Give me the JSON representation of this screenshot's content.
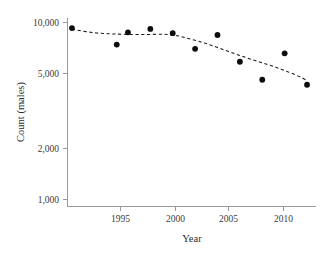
{
  "chart_data": {
    "type": "scatter",
    "title": "",
    "subtitle": "",
    "xlabel": "Year",
    "ylabel": "Count (males)",
    "yscale": "log",
    "xscale": "linear",
    "grid": false,
    "legend": null,
    "xlim": [
      1990.6,
      2012.8
    ],
    "ylim": [
      1000,
      11000
    ],
    "xticks": [
      1995,
      2000,
      2005,
      2010
    ],
    "xtick_labels": [
      "1995",
      "2000",
      "2005",
      "2010"
    ],
    "yticks": [
      1000,
      2000,
      5000,
      10000
    ],
    "ytick_labels": [
      "1,000",
      "2,000",
      "5,000",
      "10,000"
    ],
    "marker": "filled-circle",
    "marker_color": "#0d0d0d",
    "x": [
      1991,
      1995,
      1996,
      1998,
      2000,
      2002,
      2004,
      2006,
      2008,
      2010,
      2012
    ],
    "values": [
      9300,
      7500,
      8800,
      9200,
      8700,
      7100,
      8500,
      6000,
      4750,
      6700,
      4450
    ],
    "points": [
      {
        "x": 1991,
        "y": 9300
      },
      {
        "x": 1995,
        "y": 7500
      },
      {
        "x": 1996,
        "y": 8800
      },
      {
        "x": 1998,
        "y": 9200
      },
      {
        "x": 2000,
        "y": 8700
      },
      {
        "x": 2002,
        "y": 7100
      },
      {
        "x": 2004,
        "y": 8500
      },
      {
        "x": 2006,
        "y": 6000
      },
      {
        "x": 2008,
        "y": 4750
      },
      {
        "x": 2010,
        "y": 6700
      },
      {
        "x": 2012,
        "y": 4450
      }
    ],
    "series": [
      {
        "name": "Count (males)",
        "type": "scatter",
        "values": [
          9300,
          7500,
          8800,
          9200,
          8700,
          7100,
          8500,
          6000,
          4750,
          6700,
          4450
        ]
      },
      {
        "name": "Smoothed trend",
        "type": "line",
        "style": "dashed",
        "x": [
          1991,
          1993,
          1995,
          1997,
          1999,
          2000,
          2001,
          2003,
          2005,
          2007,
          2009,
          2011,
          2012
        ],
        "values": [
          9150,
          8750,
          8600,
          8550,
          8580,
          8500,
          8250,
          7600,
          6850,
          6200,
          5650,
          5050,
          4700
        ]
      }
    ],
    "annotations": []
  },
  "axes": {
    "y_title": "Count (males)",
    "x_title": "Year",
    "y_tick_0": "10,000",
    "y_tick_1": "5,000",
    "y_tick_2": "2,000",
    "y_tick_3": "1,000",
    "x_tick_0": "1995",
    "x_tick_1": "2000",
    "x_tick_2": "2005",
    "x_tick_3": "2010"
  }
}
